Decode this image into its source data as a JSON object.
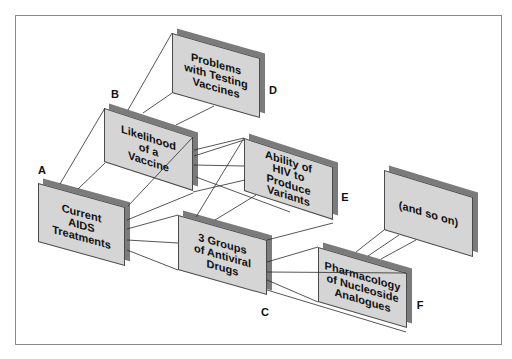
{
  "nodes": [
    {
      "label": "A",
      "lines": [
        "Current",
        "AIDS",
        "Treatments"
      ]
    },
    {
      "label": "B",
      "lines": [
        "Likelihood",
        "of a",
        "Vaccine"
      ]
    },
    {
      "label": "C",
      "lines": [
        "3 Groups",
        "of Antiviral",
        "Drugs"
      ]
    },
    {
      "label": "D",
      "lines": [
        "Problems",
        "with Testing",
        "Vaccines"
      ]
    },
    {
      "label": "E",
      "lines": [
        "Ability of",
        "HIV to",
        "Produce",
        "Variants"
      ]
    },
    {
      "label": "F",
      "lines": [
        "Pharmacology",
        "of Nucleoside",
        "Analogues"
      ]
    },
    {
      "label": "",
      "lines": [
        "(and so on)"
      ]
    }
  ],
  "connections": [
    [
      "A",
      "B"
    ],
    [
      "B",
      "D"
    ],
    [
      "B",
      "E"
    ],
    [
      "A",
      "C"
    ],
    [
      "E",
      "C"
    ],
    [
      "C",
      "F"
    ],
    [
      "F",
      "(and so on)"
    ]
  ],
  "colors": {
    "face": "#d5d5d5",
    "shadow": "#7b7b7b",
    "line": "#2b2b2b",
    "frame": "#8a8a8a",
    "text": "#111111"
  }
}
